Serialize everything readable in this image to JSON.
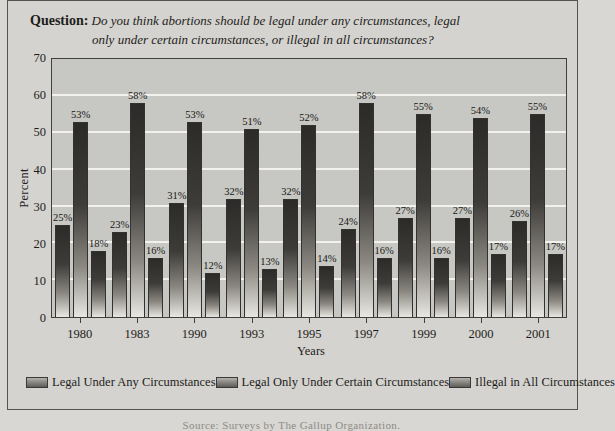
{
  "question": {
    "prefix": "Question:",
    "line1": "Do you think abortions should be legal under any circumstances, legal",
    "line2": "only under certain circumstances, or illegal in all circumstances?"
  },
  "chart_data": {
    "type": "bar",
    "categories": [
      "1980",
      "1983",
      "1990",
      "1993",
      "1995",
      "1997",
      "1999",
      "2000",
      "2001"
    ],
    "series": [
      {
        "name": "Legal Under Any Circumstances",
        "values": [
          25,
          23,
          31,
          32,
          32,
          24,
          27,
          27,
          26
        ]
      },
      {
        "name": "Legal Only Under Certain Circumstances",
        "values": [
          53,
          58,
          53,
          51,
          52,
          58,
          55,
          54,
          55
        ]
      },
      {
        "name": "Illegal in All Circumstances",
        "values": [
          18,
          16,
          12,
          13,
          14,
          16,
          16,
          17,
          17
        ]
      }
    ],
    "value_suffix": "%",
    "xlabel": "Years",
    "ylabel": "Percent",
    "ylim": [
      0,
      70
    ],
    "ytick_step": 10,
    "grid": true,
    "legend_position": "bottom"
  },
  "footer": {
    "clipped_text": "Source: Surveys by The Gallup Organization."
  }
}
